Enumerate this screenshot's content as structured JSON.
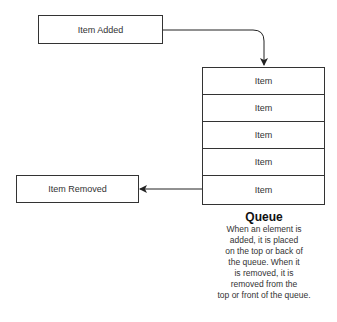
{
  "diagram": {
    "added_box": {
      "label": "Item Added"
    },
    "removed_box": {
      "label": "Item Removed"
    },
    "queue": {
      "items": [
        {
          "label": "Item"
        },
        {
          "label": "Item"
        },
        {
          "label": "Item"
        },
        {
          "label": "Item"
        },
        {
          "label": "Item"
        }
      ]
    },
    "caption": {
      "title": "Queue",
      "lines": [
        "When an element is",
        "added, it is placed",
        "on the top or back of",
        "the queue.  When it",
        "is removed, it is",
        "removed from the",
        "top or front of the queue."
      ]
    },
    "colors": {
      "stroke": "#333333",
      "background": "#ffffff"
    }
  }
}
